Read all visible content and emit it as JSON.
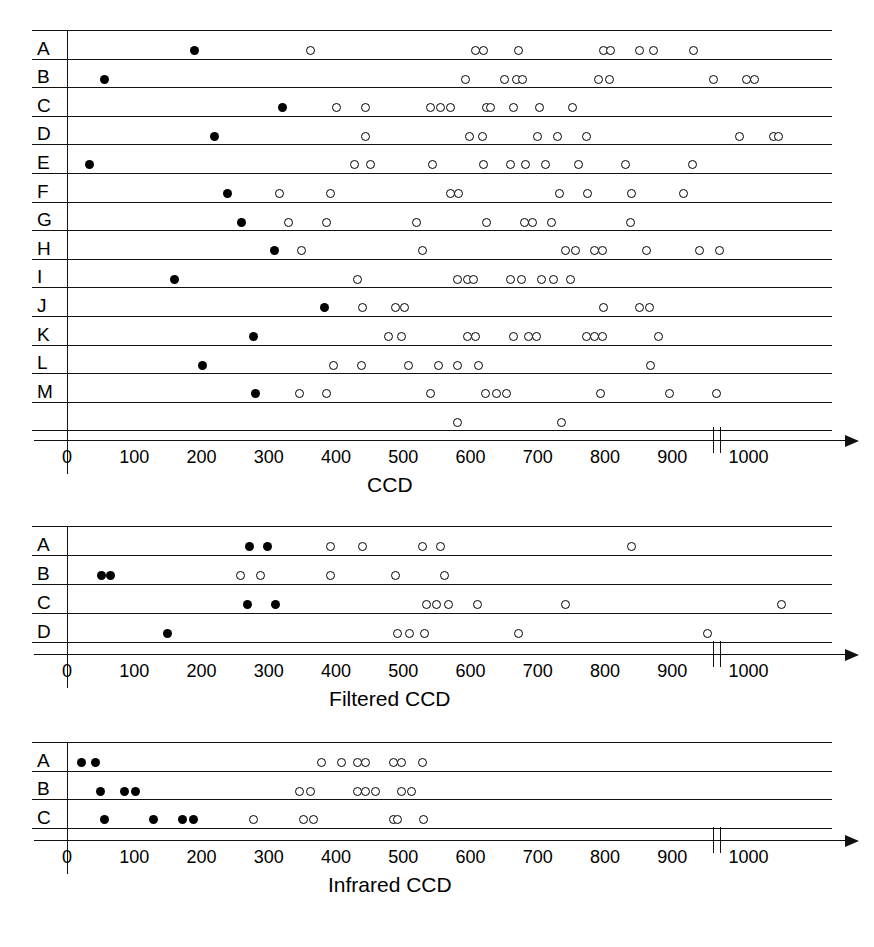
{
  "figure": {
    "background": "#ffffff",
    "foreground": "#000000",
    "marker_legend": {
      "filled": "filled-circle",
      "open": "open-circle"
    }
  },
  "chart_data": [
    {
      "type": "scatter",
      "title": "",
      "xlabel": "CCD",
      "ylabel": "",
      "xlim": [
        0,
        1080
      ],
      "xticks": [
        0,
        100,
        200,
        300,
        400,
        500,
        600,
        700,
        800,
        900,
        1000
      ],
      "xticklabels": [
        "0",
        "100",
        "200",
        "300",
        "400",
        "500",
        "600",
        "700",
        "800",
        "900",
        "1000"
      ],
      "axis_break_at": 960,
      "grid": false,
      "legend": "none",
      "categories": [
        "A",
        "B",
        "C",
        "D",
        "E",
        "F",
        "G",
        "H",
        "I",
        "J",
        "K",
        "L",
        "M",
        ""
      ],
      "rows": [
        {
          "label": "A",
          "filled": [
            190
          ],
          "open": [
            362,
            608,
            620,
            672,
            798,
            808,
            852,
            872,
            932
          ]
        },
        {
          "label": "B",
          "filled": [
            56
          ],
          "open": [
            592,
            650,
            668,
            678,
            790,
            806,
            962,
            1010,
            1022
          ]
        },
        {
          "label": "C",
          "filled": [
            320
          ],
          "open": [
            401,
            444,
            540,
            556,
            570,
            624,
            630,
            664,
            702,
            752
          ]
        },
        {
          "label": "D",
          "filled": [
            219
          ],
          "open": [
            444,
            598,
            618,
            700,
            730,
            772,
            1000,
            1050,
            1058
          ]
        },
        {
          "label": "E",
          "filled": [
            34
          ],
          "open": [
            428,
            452,
            544,
            620,
            660,
            682,
            712,
            760,
            830,
            930
          ]
        },
        {
          "label": "F",
          "filled": [
            238
          ],
          "open": [
            316,
            392,
            570,
            582,
            732,
            774,
            840,
            916
          ]
        },
        {
          "label": "G",
          "filled": [
            260
          ],
          "open": [
            330,
            386,
            520,
            624,
            680,
            692,
            720,
            838
          ]
        },
        {
          "label": "H",
          "filled": [
            308
          ],
          "open": [
            348,
            528,
            742,
            756,
            784,
            796,
            862,
            940,
            970
          ]
        },
        {
          "label": "I",
          "filled": [
            160
          ],
          "open": [
            432,
            580,
            596,
            604,
            660,
            676,
            706,
            724,
            748
          ]
        },
        {
          "label": "J",
          "filled": [
            383
          ],
          "open": [
            440,
            488,
            502,
            798,
            852,
            866
          ]
        },
        {
          "label": "K",
          "filled": [
            278
          ],
          "open": [
            478,
            498,
            596,
            608,
            664,
            686,
            698,
            772,
            784,
            796,
            880
          ]
        },
        {
          "label": "L",
          "filled": [
            201
          ],
          "open": [
            396,
            438,
            508,
            552,
            580,
            612,
            868
          ]
        },
        {
          "label": "M",
          "filled": [
            281
          ],
          "open": [
            346,
            386,
            540,
            622,
            638,
            654,
            794,
            896,
            966
          ]
        },
        {
          "label": "",
          "filled": [],
          "open": [
            580,
            736
          ]
        }
      ]
    },
    {
      "type": "scatter",
      "title": "",
      "xlabel": "Filtered CCD",
      "ylabel": "",
      "xlim": [
        0,
        1080
      ],
      "xticks": [
        0,
        100,
        200,
        300,
        400,
        500,
        600,
        700,
        800,
        900,
        1000
      ],
      "xticklabels": [
        "0",
        "100",
        "200",
        "300",
        "400",
        "500",
        "600",
        "700",
        "800",
        "900",
        "1000"
      ],
      "axis_break_at": 960,
      "grid": false,
      "legend": "none",
      "categories": [
        "A",
        "B",
        "C",
        "D"
      ],
      "rows": [
        {
          "label": "A",
          "filled": [
            272,
            298
          ],
          "open": [
            392,
            440,
            528,
            556,
            840
          ]
        },
        {
          "label": "B",
          "filled": [
            52,
            64
          ],
          "open": [
            258,
            288,
            392,
            488,
            562
          ]
        },
        {
          "label": "C",
          "filled": [
            268,
            310
          ],
          "open": [
            534,
            550,
            568,
            610,
            742,
            1062
          ]
        },
        {
          "label": "D",
          "filled": [
            150
          ],
          "open": [
            492,
            510,
            532,
            672,
            952
          ]
        }
      ]
    },
    {
      "type": "scatter",
      "title": "",
      "xlabel": "Infrared CCD",
      "ylabel": "",
      "xlim": [
        0,
        1080
      ],
      "xticks": [
        0,
        100,
        200,
        300,
        400,
        500,
        600,
        700,
        800,
        900,
        1000
      ],
      "xticklabels": [
        "0",
        "100",
        "200",
        "300",
        "400",
        "500",
        "600",
        "700",
        "800",
        "900",
        "1000"
      ],
      "axis_break_at": 960,
      "grid": false,
      "legend": "none",
      "categories": [
        "A",
        "B",
        "C"
      ],
      "rows": [
        {
          "label": "A",
          "filled": [
            22,
            42
          ],
          "open": [
            378,
            408,
            432,
            444,
            486,
            498,
            528
          ]
        },
        {
          "label": "B",
          "filled": [
            50,
            86,
            102
          ],
          "open": [
            346,
            362,
            432,
            444,
            458,
            498,
            512
          ]
        },
        {
          "label": "C",
          "filled": [
            56,
            128,
            172,
            188
          ],
          "open": [
            278,
            352,
            366,
            486,
            492,
            530
          ]
        }
      ]
    }
  ],
  "panels": [
    {
      "name": "ccd-panel",
      "axis_title": "CCD",
      "row_labels": [
        "A",
        "B",
        "C",
        "D",
        "E",
        "F",
        "G",
        "H",
        "I",
        "J",
        "K",
        "L",
        "M"
      ],
      "tick_labels": [
        "0",
        "100",
        "200",
        "300",
        "400",
        "500",
        "600",
        "700",
        "800",
        "900",
        "1000"
      ]
    },
    {
      "name": "filtered-ccd-panel",
      "axis_title": "Filtered CCD",
      "row_labels": [
        "A",
        "B",
        "C",
        "D"
      ],
      "tick_labels": [
        "0",
        "100",
        "200",
        "300",
        "400",
        "500",
        "600",
        "700",
        "800",
        "900",
        "1000"
      ]
    },
    {
      "name": "infrared-ccd-panel",
      "axis_title": "Infrared CCD",
      "row_labels": [
        "A",
        "B",
        "C"
      ],
      "tick_labels": [
        "0",
        "100",
        "200",
        "300",
        "400",
        "500",
        "600",
        "700",
        "800",
        "900",
        "1000"
      ]
    }
  ]
}
